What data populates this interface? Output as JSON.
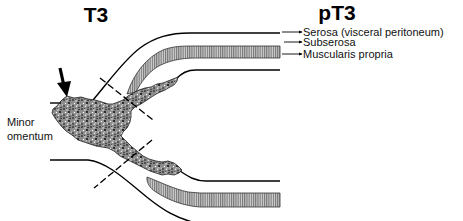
{
  "figure": {
    "left_title": "T3",
    "right_title": "pT3",
    "layer_labels": [
      {
        "id": "serosa",
        "text": "Serosa (visceral peritoneum)"
      },
      {
        "id": "subserosa",
        "text": "Subserosa"
      },
      {
        "id": "muscularis",
        "text": "Muscularis propria"
      }
    ],
    "side_label": {
      "line1": "Minor",
      "line2": "omentum"
    },
    "icons": {
      "pointer_arrow": "down-arrow-icon",
      "label_pointers": "right-arrow-icon"
    },
    "colors": {
      "ink": "#000000",
      "background": "#ffffff",
      "tumor_base": "#8c8c8c",
      "muscularis_fill": "#d0d0d0",
      "muscularis_hatch": "#555555"
    }
  }
}
